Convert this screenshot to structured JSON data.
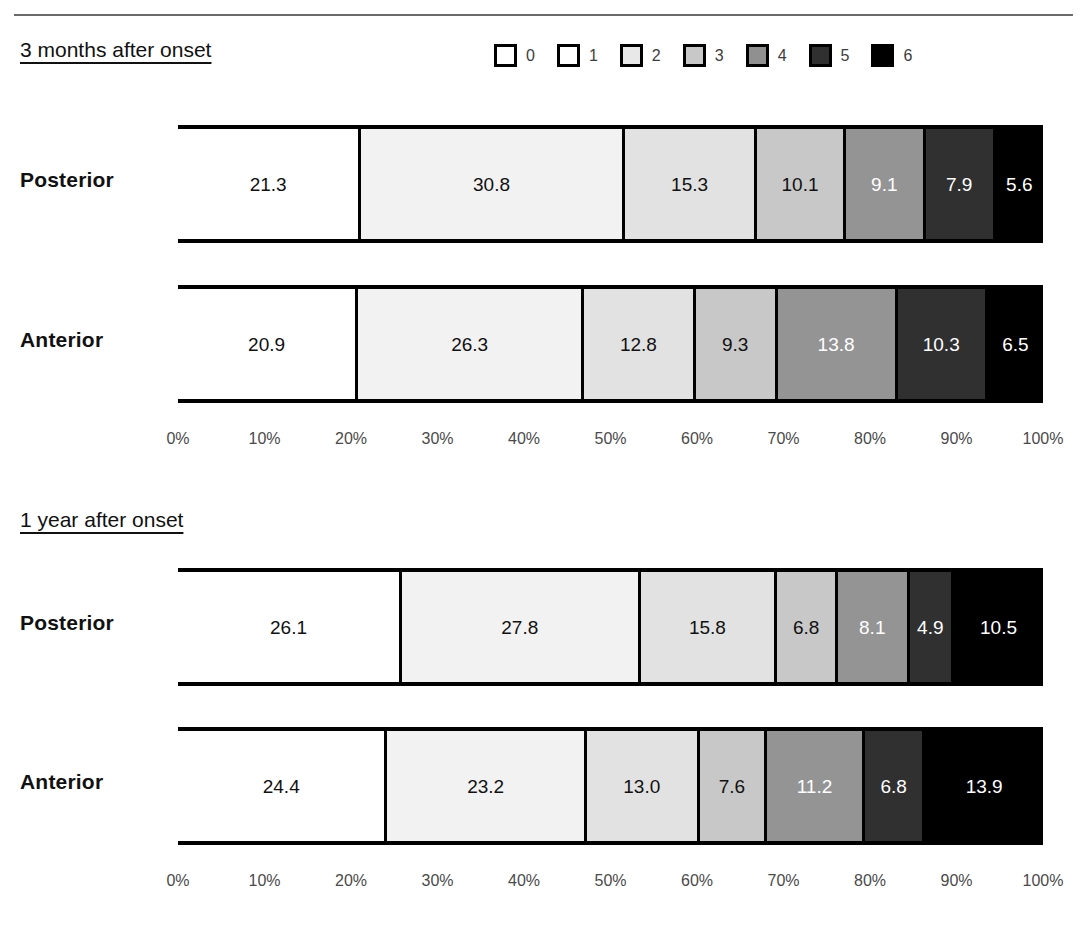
{
  "legend": {
    "title": "modified Rankin Scale",
    "items": [
      {
        "label": "0",
        "color": "#ffffff"
      },
      {
        "label": "1",
        "color": "#ffffff"
      },
      {
        "label": "2",
        "color": "#e8e8e8"
      },
      {
        "label": "3",
        "color": "#c8c8c8"
      },
      {
        "label": "4",
        "color": "#909090"
      },
      {
        "label": "5",
        "color": "#303030"
      },
      {
        "label": "6",
        "color": "#000000"
      }
    ]
  },
  "axis": {
    "ticks": [
      "0%",
      "10%",
      "20%",
      "30%",
      "40%",
      "50%",
      "60%",
      "70%",
      "80%",
      "90%",
      "100%"
    ]
  },
  "panels": [
    {
      "title": "3 months after onset",
      "rows": [
        {
          "label": "Posterior",
          "values": [
            21.3,
            0.0,
            30.8,
            15.3,
            10.1,
            9.1,
            7.9,
            5.6
          ],
          "segments": [
            {
              "label": "21.3",
              "value": 21.3,
              "color": "#ffffff",
              "text_color": "#111111"
            },
            {
              "label": "30.8",
              "value": 30.8,
              "color": "#f2f2f2",
              "text_color": "#111111"
            },
            {
              "label": "15.3",
              "value": 15.3,
              "color": "#e2e2e2",
              "text_color": "#111111"
            },
            {
              "label": "10.1",
              "value": 10.1,
              "color": "#c8c8c8",
              "text_color": "#111111"
            },
            {
              "label": "9.1",
              "value": 9.1,
              "color": "#949494",
              "text_color": "#ffffff"
            },
            {
              "label": "7.9",
              "value": 7.9,
              "color": "#303030",
              "text_color": "#ffffff"
            },
            {
              "label": "5.6",
              "value": 5.6,
              "color": "#000000",
              "text_color": "#ffffff"
            }
          ]
        },
        {
          "label": "Anterior",
          "values": [
            20.9,
            0.0,
            26.3,
            12.8,
            9.3,
            13.8,
            10.3,
            6.5
          ],
          "segments": [
            {
              "label": "20.9",
              "value": 20.9,
              "color": "#ffffff",
              "text_color": "#111111"
            },
            {
              "label": "26.3",
              "value": 26.3,
              "color": "#f2f2f2",
              "text_color": "#111111"
            },
            {
              "label": "12.8",
              "value": 12.8,
              "color": "#e2e2e2",
              "text_color": "#111111"
            },
            {
              "label": "9.3",
              "value": 9.3,
              "color": "#c8c8c8",
              "text_color": "#111111"
            },
            {
              "label": "13.8",
              "value": 13.8,
              "color": "#949494",
              "text_color": "#ffffff"
            },
            {
              "label": "10.3",
              "value": 10.3,
              "color": "#303030",
              "text_color": "#ffffff"
            },
            {
              "label": "6.5",
              "value": 6.5,
              "color": "#000000",
              "text_color": "#ffffff"
            }
          ]
        }
      ]
    },
    {
      "title": "1 year after onset",
      "rows": [
        {
          "label": "Posterior",
          "values": [
            26.1,
            0.0,
            27.8,
            15.8,
            6.8,
            8.1,
            4.9,
            10.5
          ],
          "segments": [
            {
              "label": "26.1",
              "value": 26.1,
              "color": "#ffffff",
              "text_color": "#111111"
            },
            {
              "label": "27.8",
              "value": 27.8,
              "color": "#f2f2f2",
              "text_color": "#111111"
            },
            {
              "label": "15.8",
              "value": 15.8,
              "color": "#e2e2e2",
              "text_color": "#111111"
            },
            {
              "label": "6.8",
              "value": 6.8,
              "color": "#c8c8c8",
              "text_color": "#111111"
            },
            {
              "label": "8.1",
              "value": 8.1,
              "color": "#949494",
              "text_color": "#ffffff"
            },
            {
              "label": "4.9",
              "value": 4.9,
              "color": "#303030",
              "text_color": "#ffffff"
            },
            {
              "label": "10.5",
              "value": 10.5,
              "color": "#000000",
              "text_color": "#ffffff"
            }
          ]
        },
        {
          "label": "Anterior",
          "values": [
            24.4,
            0.0,
            23.2,
            13.0,
            7.6,
            11.2,
            6.8,
            13.9
          ],
          "segments": [
            {
              "label": "24.4",
              "value": 24.4,
              "color": "#ffffff",
              "text_color": "#111111"
            },
            {
              "label": "23.2",
              "value": 23.2,
              "color": "#f2f2f2",
              "text_color": "#111111"
            },
            {
              "label": "13.0",
              "value": 13.0,
              "color": "#e2e2e2",
              "text_color": "#111111"
            },
            {
              "label": "7.6",
              "value": 7.6,
              "color": "#c8c8c8",
              "text_color": "#111111"
            },
            {
              "label": "11.2",
              "value": 11.2,
              "color": "#949494",
              "text_color": "#ffffff"
            },
            {
              "label": "6.8",
              "value": 6.8,
              "color": "#303030",
              "text_color": "#ffffff"
            },
            {
              "label": "13.9",
              "value": 13.9,
              "color": "#000000",
              "text_color": "#ffffff"
            }
          ]
        }
      ]
    }
  ],
  "chart_data": {
    "type": "bar",
    "subtype": "stacked-horizontal-100pct",
    "title": "",
    "xlabel": "",
    "ylabel": "",
    "xlim": [
      0,
      100
    ],
    "grid": false,
    "legend_position": "top-right",
    "legend_entries": [
      "0",
      "1",
      "2",
      "3",
      "4",
      "5",
      "6"
    ],
    "xticks": [
      "0%",
      "10%",
      "20%",
      "30%",
      "40%",
      "50%",
      "60%",
      "70%",
      "80%",
      "90%",
      "100%"
    ],
    "panels": [
      {
        "title": "3 months after onset",
        "categories": [
          "Posterior",
          "Anterior"
        ],
        "series": [
          {
            "name": "0",
            "values": [
              21.3,
              20.9
            ]
          },
          {
            "name": "1",
            "values": [
              0.0,
              0.0
            ]
          },
          {
            "name": "2",
            "values": [
              30.8,
              26.3
            ]
          },
          {
            "name": "3",
            "values": [
              15.3,
              12.8
            ]
          },
          {
            "name": "4",
            "values": [
              10.1,
              9.3
            ]
          },
          {
            "name": "5",
            "values": [
              9.1,
              13.8
            ]
          },
          {
            "name": "6",
            "values": [
              7.9,
              10.3
            ]
          },
          {
            "name": "7",
            "values": [
              5.6,
              6.5
            ]
          }
        ]
      },
      {
        "title": "1 year after onset",
        "categories": [
          "Posterior",
          "Anterior"
        ],
        "series": [
          {
            "name": "0",
            "values": [
              26.1,
              24.4
            ]
          },
          {
            "name": "1",
            "values": [
              0.0,
              0.0
            ]
          },
          {
            "name": "2",
            "values": [
              27.8,
              23.2
            ]
          },
          {
            "name": "3",
            "values": [
              15.8,
              13.0
            ]
          },
          {
            "name": "4",
            "values": [
              6.8,
              7.6
            ]
          },
          {
            "name": "5",
            "values": [
              8.1,
              11.2
            ]
          },
          {
            "name": "6",
            "values": [
              4.9,
              6.8
            ]
          },
          {
            "name": "7",
            "values": [
              10.5,
              13.9
            ]
          }
        ]
      }
    ]
  }
}
